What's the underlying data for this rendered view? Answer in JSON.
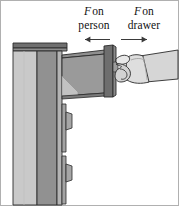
{
  "figure": {
    "background_color": "#ffffff",
    "border_color": "#a8a8a8"
  },
  "labels": {
    "left": {
      "symbol": "F",
      "line1_rest": "on",
      "line2": "person",
      "arrow_direction": "left",
      "arrow_name": "arrow-left"
    },
    "right": {
      "symbol": "F",
      "line1_rest": "on",
      "line2": "drawer",
      "arrow_direction": "right",
      "arrow_name": "arrow-right"
    }
  },
  "colors": {
    "counter_top": "#6f6f6f",
    "counter_top_face": "#8c8c8c",
    "cabinet_front_light": "#c9c9c9",
    "cabinet_side_dark": "#919191",
    "cabinet_edge_strip": "#b4b4b4",
    "drawer_box": "#9a9a9a",
    "drawer_box_light": "#c2c2c2",
    "drawer_front": "#6e6e6e",
    "drawer_front_edge": "#8a8a8a",
    "handle": "#a6a6a6",
    "hand_fill": "#d6d6d6",
    "hand_fill_light": "#e8e8e8",
    "outline": "#2b2b2b",
    "arrow": "#3a3a3a",
    "text": "#111111"
  },
  "scene": {
    "cabinet_name": "cabinet",
    "counter_name": "counter-top",
    "open_drawer_name": "open-drawer",
    "drawer_front_name": "drawer-front-panel",
    "hand_name": "hand-gripping-drawer",
    "lower_drawers": [
      {
        "name": "lower-drawer-1"
      },
      {
        "name": "lower-drawer-2"
      }
    ]
  }
}
